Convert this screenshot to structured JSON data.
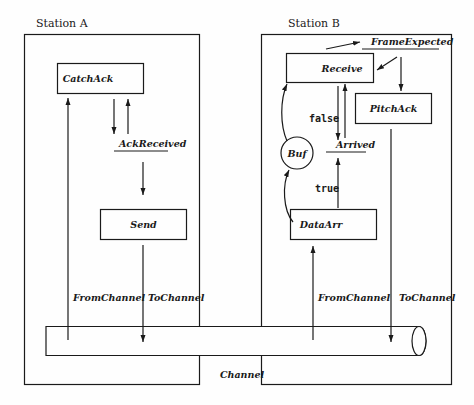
{
  "diagram": {
    "stations": [
      {
        "id": "A",
        "label": "Station A"
      },
      {
        "id": "B",
        "label": "Station B"
      }
    ],
    "station_a": {
      "processes": {
        "catch_ack": "CatchAck",
        "send": "Send"
      },
      "variables": {
        "ack_received": "AckReceived"
      },
      "channel_labels": {
        "from_channel": "FromChannel",
        "to_channel": "ToChannel"
      }
    },
    "station_b": {
      "processes": {
        "receive": "Receive",
        "pitch_ack": "PitchAck",
        "data_arr": "DataArr"
      },
      "variables": {
        "frame_expected": "FrameExpected",
        "arrived": "Arrived"
      },
      "buffer": "Buf",
      "conditions": {
        "false_label": "false",
        "true_label": "true"
      },
      "channel_labels": {
        "from_channel": "FromChannel",
        "to_channel": "ToChannel"
      }
    },
    "channel": {
      "label": "Channel"
    },
    "colors": {
      "stroke": "#1a1a1a",
      "background": "#fefefe"
    }
  }
}
